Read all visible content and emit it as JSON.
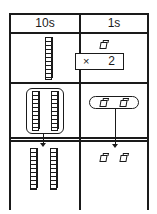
{
  "table": {
    "columns": [
      {
        "label": "10s"
      },
      {
        "label": "1s"
      }
    ],
    "rows": [
      {
        "tens": {
          "rods": 1
        },
        "ones": {
          "cubes": 1,
          "multiplier_symbol": "×",
          "multiplier_value": "2"
        }
      },
      {
        "tens": {
          "rods": 2,
          "grouped": true
        },
        "ones": {
          "cubes": 2,
          "grouped": true
        }
      },
      {
        "tens": {
          "rods": 2
        },
        "ones": {
          "cubes": 2
        }
      }
    ]
  },
  "colors": {
    "ink": "#1a1a1a",
    "background": "#ffffff"
  }
}
